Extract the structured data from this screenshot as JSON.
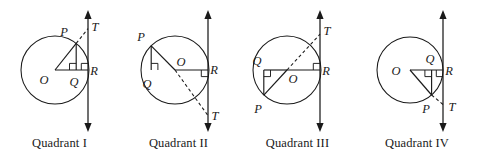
{
  "figure": {
    "panel_count": 4,
    "stroke_color": "#1a1a1a",
    "background_color": "#ffffff"
  },
  "panels": [
    {
      "id": "quadrant-1",
      "caption": "Quadrant I",
      "circle": {
        "cx": 55,
        "cy": 70,
        "r": 34
      },
      "tangent_line_x": 88,
      "points": {
        "O": {
          "label": "O",
          "x": 55,
          "y": 70,
          "label_x": 44,
          "label_y": 84
        },
        "P": {
          "label": "P",
          "x": 76.2,
          "y": 43.4,
          "label_x": 64,
          "label_y": 36
        },
        "Q": {
          "label": "Q",
          "x": 76.2,
          "y": 70,
          "label_x": 72,
          "label_y": 86
        },
        "R": {
          "label": "R",
          "x": 88,
          "y": 70,
          "label_x": 92,
          "label_y": 74
        },
        "T": {
          "label": "T",
          "x": 88,
          "y": 28.6,
          "label_x": 93,
          "label_y": 30
        }
      },
      "segments": [
        {
          "name": "radius-OP",
          "from": "O",
          "to": "P",
          "style": "solid"
        },
        {
          "name": "radius-OR",
          "from": "O",
          "to": "R",
          "style": "solid"
        },
        {
          "name": "perpendicular-PQ",
          "from": "P",
          "to": "Q",
          "style": "solid"
        },
        {
          "name": "secant-PT",
          "from": "P",
          "to": "T",
          "style": "dashed"
        }
      ],
      "right_angles": [
        "at-Q",
        "at-R"
      ]
    },
    {
      "id": "quadrant-2",
      "caption": "Quadrant II",
      "circle": {
        "cx": 175,
        "cy": 70,
        "r": 34
      },
      "tangent_line_x": 208,
      "points": {
        "O": {
          "label": "O",
          "x": 175,
          "y": 70,
          "label_x": 179,
          "label_y": 65
        },
        "P": {
          "label": "P",
          "x": 151.2,
          "y": 45.8,
          "label_x": 140,
          "label_y": 40
        },
        "Q": {
          "label": "Q",
          "x": 151.2,
          "y": 70,
          "label_x": 144,
          "label_y": 87
        },
        "R": {
          "label": "R",
          "x": 208,
          "y": 70,
          "label_x": 212,
          "label_y": 74
        },
        "T": {
          "label": "T",
          "x": 208,
          "y": 115.6,
          "label_x": 213,
          "label_y": 119
        }
      },
      "segments": [
        {
          "name": "radius-OP",
          "from": "O",
          "to": "P",
          "style": "solid"
        },
        {
          "name": "radius-OR",
          "from": "O",
          "to": "R",
          "style": "solid"
        },
        {
          "name": "perpendicular-PQ",
          "from": "P",
          "to": "Q",
          "style": "solid"
        },
        {
          "name": "secant-OT",
          "from": "O",
          "to": "T",
          "style": "dashed"
        }
      ],
      "right_angles": [
        "at-Q",
        "at-R"
      ]
    },
    {
      "id": "quadrant-3",
      "caption": "Quadrant III",
      "circle": {
        "cx": 287,
        "cy": 70,
        "r": 34
      },
      "tangent_line_x": 320,
      "points": {
        "O": {
          "label": "O",
          "x": 287,
          "y": 70,
          "label_x": 291,
          "label_y": 82
        },
        "P": {
          "label": "P",
          "x": 263.8,
          "y": 95.2,
          "label_x": 256,
          "label_y": 111
        },
        "Q": {
          "label": "Q",
          "x": 263.8,
          "y": 70,
          "label_x": 255,
          "label_y": 65
        },
        "R": {
          "label": "R",
          "x": 320,
          "y": 70,
          "label_x": 324,
          "label_y": 74
        },
        "T": {
          "label": "T",
          "x": 320,
          "y": 34.2,
          "label_x": 325,
          "label_y": 34
        }
      },
      "segments": [
        {
          "name": "radius-OP",
          "from": "O",
          "to": "P",
          "style": "solid"
        },
        {
          "name": "radius-OR",
          "from": "O",
          "to": "R",
          "style": "solid"
        },
        {
          "name": "perpendicular-PQ",
          "from": "P",
          "to": "Q",
          "style": "solid"
        },
        {
          "name": "secant-OT",
          "from": "O",
          "to": "T",
          "style": "dashed"
        }
      ],
      "right_angles": [
        "at-Q",
        "at-R"
      ]
    },
    {
      "id": "quadrant-4",
      "caption": "Quadrant IV",
      "circle": {
        "cx": 410,
        "cy": 70,
        "r": 33
      },
      "tangent_line_x": 443,
      "points": {
        "O": {
          "label": "O",
          "x": 410,
          "y": 70,
          "label_x": 396,
          "label_y": 74
        },
        "P": {
          "label": "P",
          "x": 431.6,
          "y": 95.0,
          "label_x": 424,
          "label_y": 111
        },
        "Q": {
          "label": "Q",
          "x": 431.6,
          "y": 70,
          "label_x": 427,
          "label_y": 62
        },
        "R": {
          "label": "R",
          "x": 443,
          "y": 70,
          "label_x": 447,
          "label_y": 74
        },
        "T": {
          "label": "T",
          "x": 443,
          "y": 104.5,
          "label_x": 449,
          "label_y": 110
        }
      },
      "segments": [
        {
          "name": "radius-OP",
          "from": "O",
          "to": "P",
          "style": "solid"
        },
        {
          "name": "radius-OR",
          "from": "O",
          "to": "R",
          "style": "solid"
        },
        {
          "name": "perpendicular-PQ",
          "from": "P",
          "to": "Q",
          "style": "solid"
        },
        {
          "name": "secant-PT",
          "from": "P",
          "to": "T",
          "style": "dashed"
        }
      ],
      "right_angles": [
        "at-Q",
        "at-R"
      ]
    }
  ]
}
